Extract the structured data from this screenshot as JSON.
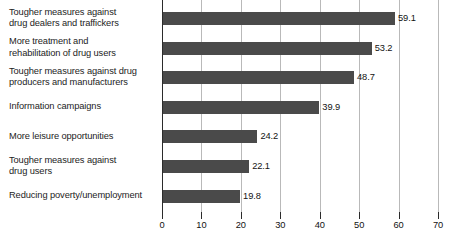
{
  "chart_data": {
    "type": "bar",
    "orientation": "horizontal",
    "title": "",
    "subtitle": "",
    "xlabel": "",
    "ylabel": "",
    "xlim": [
      0,
      70
    ],
    "xticks": [
      0,
      10,
      20,
      30,
      40,
      50,
      60,
      70
    ],
    "xtick_labels": [
      "0",
      "10",
      "20",
      "30",
      "40",
      "50",
      "60",
      "70"
    ],
    "grid": true,
    "legend": false,
    "legend_position": "none",
    "bar_color": "#4a4a4a",
    "gridline_color": "#b9b9b9",
    "axis_color": "#2b2b2b",
    "categories": [
      "Tougher measures against\ndrug dealers and traffickers",
      "More treatment and\nrehabilitation of drug users",
      "Tougher measures against drug\nproducers and manufacturers",
      "Information campaigns",
      "More leisure opportunities",
      "Tougher measures against\ndrug users",
      "Reducing poverty/unemployment"
    ],
    "values": [
      59.1,
      53.2,
      48.7,
      39.9,
      24.2,
      22.1,
      19.8
    ],
    "value_labels": [
      "59.1",
      "53.2",
      "48.7",
      "39.9",
      "24.2",
      "22.1",
      "19.8"
    ]
  }
}
